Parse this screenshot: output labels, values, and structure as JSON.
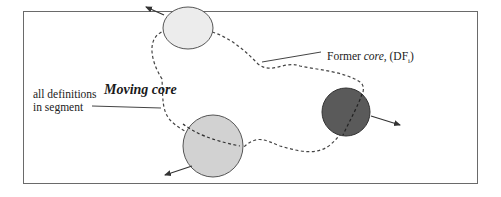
{
  "diagram": {
    "title_label": "Moving core",
    "left_label_line1": "all definitions",
    "left_label_line2": "in segment",
    "former_label_prefix": "Former ",
    "former_label_core": "core,",
    "former_label_df": " (DF",
    "former_label_sub": "i",
    "former_label_close": ")",
    "colors": {
      "frame": "#6a6a6a",
      "circle_light": "#ececec",
      "circle_medium": "#d2d2d2",
      "circle_dark": "#5a5a5a",
      "outline": "#555555",
      "dashed": "#444444"
    },
    "circles": [
      {
        "name": "former-position-circle",
        "cx": 188,
        "cy": 28,
        "rx": 25,
        "ry": 21,
        "fill": "light"
      },
      {
        "name": "segment-circle-large",
        "cx": 213,
        "cy": 146,
        "rx": 30,
        "ry": 31,
        "fill": "medium"
      },
      {
        "name": "segment-circle-dark",
        "cx": 346,
        "cy": 112,
        "rx": 24,
        "ry": 24,
        "fill": "dark"
      }
    ]
  }
}
